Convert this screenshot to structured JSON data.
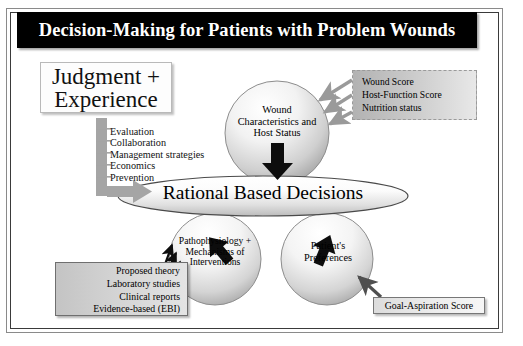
{
  "title": "Decision-Making for Patients with Problem Wounds",
  "judgment": {
    "line1": "Judgment +",
    "line2": "Experience"
  },
  "process_list": [
    "Evaluation",
    "Collaboration",
    "Management strategies",
    "Economics",
    "Prevention"
  ],
  "wound_circle": {
    "line1": "Wound",
    "line2": "Characteristics and",
    "line3": "Host Status"
  },
  "central_ellipse": {
    "label": "Rational Based Decisions"
  },
  "pathophysiology_circle": {
    "line1": "Pathophysiology +",
    "line2": "Mechanisms of",
    "line3": "Interventions"
  },
  "preferences_circle": {
    "line1": "Patient's",
    "line2": "Preferences"
  },
  "score_box": {
    "items": [
      "Wound Score",
      "Host-Function Score",
      "Nutrition status"
    ]
  },
  "evidence_box": {
    "items": [
      "Proposed theory",
      "Laboratory studies",
      "Clinical reports",
      "Evidence-based (EBI)"
    ]
  },
  "goal_box": {
    "label": "Goal-Aspiration Score"
  },
  "colors": {
    "title_bg": "#000000",
    "title_fg": "#ffffff",
    "gray_arrow": "#9a9a9a",
    "dark_arrow": "#000000",
    "frame_border": "#3a3a3a"
  }
}
